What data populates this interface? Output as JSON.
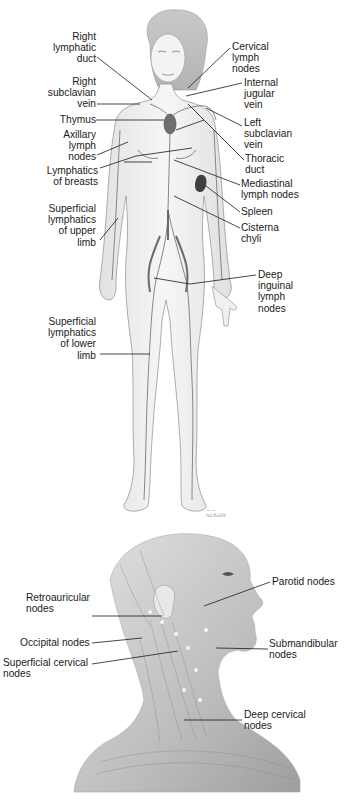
{
  "figure_top": {
    "title": "Lymphatic system — anterior view of female body",
    "labels_left": [
      {
        "id": "right-lymphatic-duct",
        "text": "Right\nlymphatic\nduct"
      },
      {
        "id": "right-subclavian-vein",
        "text": "Right\nsubclavian\nvein"
      },
      {
        "id": "thymus",
        "text": "Thymus"
      },
      {
        "id": "axillary-lymph-nodes",
        "text": "Axillary\nlymph\nnodes"
      },
      {
        "id": "lymphatics-of-breasts",
        "text": "Lymphatics\nof breasts"
      },
      {
        "id": "superficial-lymphatics-upper-limb",
        "text": "Superficial\nlymphatics\nof upper\nlimb"
      },
      {
        "id": "superficial-lymphatics-lower-limb",
        "text": "Superficial\nlymphatics\nof lower\nlimb"
      }
    ],
    "labels_right": [
      {
        "id": "cervical-lymph-nodes",
        "text": "Cervical\nlymph\nnodes"
      },
      {
        "id": "internal-jugular-vein",
        "text": "Internal\njugular\nvein"
      },
      {
        "id": "left-subclavian-vein",
        "text": "Left\nsubclavian\nvein"
      },
      {
        "id": "thoracic-duct",
        "text": "Thoracic\nduct"
      },
      {
        "id": "mediastinal-lymph-nodes",
        "text": "Mediastinal\nlymph nodes"
      },
      {
        "id": "spleen",
        "text": "Spleen"
      },
      {
        "id": "cisterna-chyli",
        "text": "Cisterna\nchyli"
      },
      {
        "id": "deep-inguinal-lymph-nodes",
        "text": "Deep\ninguinal\nlymph\nnodes"
      }
    ],
    "signature": "~ ~\nnicholls"
  },
  "figure_bottom": {
    "title": "Lymph nodes of the head and neck — lateral view",
    "labels_left": [
      {
        "id": "retroauricular-nodes",
        "text": "Retroauricular\nnodes"
      },
      {
        "id": "occipital-nodes",
        "text": "Occipital nodes"
      },
      {
        "id": "superficial-cervical-nodes",
        "text": "Superficial cervical\nnodes"
      }
    ],
    "labels_right": [
      {
        "id": "parotid-nodes",
        "text": "Parotid nodes"
      },
      {
        "id": "submandibular-nodes",
        "text": "Submandibular\nnodes"
      },
      {
        "id": "deep-cervical-nodes",
        "text": "Deep cervical\nnodes"
      }
    ]
  },
  "colors": {
    "line": "#1a1a1a",
    "skin": "#f1f1f1",
    "outline": "#8c8c8c",
    "vessel": "#7a7a7a",
    "organ_dark": "#4a4a4a",
    "shading": "#cfcfcf"
  }
}
